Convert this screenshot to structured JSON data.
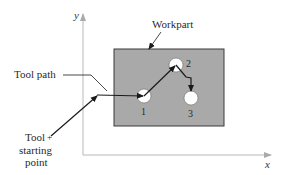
{
  "diagram": {
    "labels": {
      "workpart": "Workpart",
      "tool_path": "Tool path",
      "tool_starting_line1": "Tool",
      "tool_starting_line2": "starting",
      "tool_starting_line3": "point",
      "x_axis": "x",
      "y_axis": "y"
    },
    "points": [
      {
        "id": "1",
        "label": "1"
      },
      {
        "id": "2",
        "label": "2"
      },
      {
        "id": "3",
        "label": "3"
      }
    ],
    "colors": {
      "workpart_fill": "#a9a9a9",
      "workpart_border": "#3a3a3a",
      "axis": "#b8b8b8",
      "path": "#1a1a1a",
      "hole": "#ffffff"
    }
  }
}
